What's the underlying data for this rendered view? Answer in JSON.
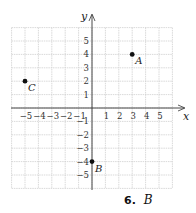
{
  "chart_data": {
    "type": "scatter",
    "title": "",
    "xlabel": "x",
    "ylabel": "y",
    "xlim": [
      -6,
      6
    ],
    "ylim": [
      -6,
      6
    ],
    "grid": true,
    "x_ticks": [
      -5,
      -4,
      -3,
      -2,
      -1,
      1,
      2,
      3,
      4,
      5
    ],
    "y_ticks": [
      5,
      4,
      3,
      2,
      1,
      -1,
      -2,
      -3,
      -4,
      -5
    ],
    "points": [
      {
        "label": "A",
        "x": 3,
        "y": 4
      },
      {
        "label": "B",
        "x": 0,
        "y": -4
      },
      {
        "label": "C",
        "x": -5,
        "y": 2
      }
    ]
  },
  "caption": {
    "number": "6.",
    "answer": "B"
  }
}
